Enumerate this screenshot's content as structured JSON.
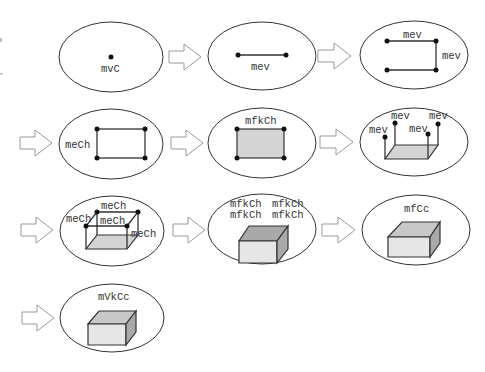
{
  "diagram": {
    "steps": [
      {
        "id": 1,
        "labels": [
          "mvC"
        ],
        "description": "make vertex, cell"
      },
      {
        "id": 2,
        "labels": [
          "mev"
        ],
        "description": "make edge, vertex"
      },
      {
        "id": 3,
        "labels": [
          "mev",
          "mev"
        ],
        "description": "two more edges/vertices"
      },
      {
        "id": 4,
        "labels": [
          "meCh"
        ],
        "description": "close loop"
      },
      {
        "id": 5,
        "labels": [
          "mfkCh"
        ],
        "description": "make face"
      },
      {
        "id": 6,
        "labels": [
          "mev",
          "mev",
          "mev",
          "mev"
        ],
        "description": "four vertical edges"
      },
      {
        "id": 7,
        "labels": [
          "meCh",
          "meCh",
          "meCh",
          "meCh"
        ],
        "description": "top edges"
      },
      {
        "id": 8,
        "labels": [
          "mfkCh",
          "mfkCh",
          "mfkCh",
          "mfkCh"
        ],
        "description": "side faces"
      },
      {
        "id": 9,
        "labels": [
          "mfCc"
        ],
        "description": "close top face"
      },
      {
        "id": 10,
        "labels": [
          "mVkCc"
        ],
        "description": "make volume"
      }
    ],
    "colors": {
      "stroke": "#333333",
      "arrow": "#999999",
      "face_light": "#d4d4d4",
      "face_side": "#a9a9a9",
      "background": "#ffffff"
    }
  }
}
